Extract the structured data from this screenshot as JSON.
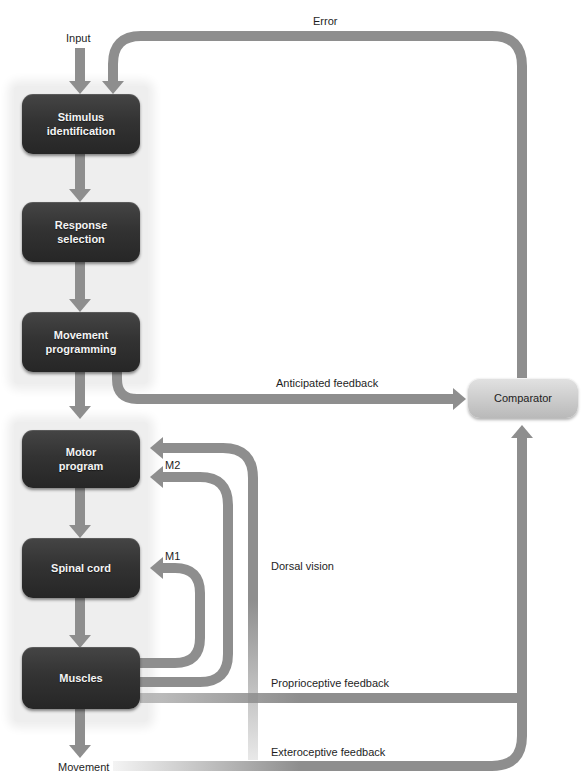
{
  "colors": {
    "arrow": "#8e8e8e",
    "box_dark_top": "#454545",
    "box_dark_bottom": "#262626",
    "comparator_top": "#e2e2e2",
    "comparator_bottom": "#b9b9b9",
    "panel": "#eeeeee"
  },
  "labels": {
    "input": "Input",
    "error": "Error",
    "anticipated_feedback": "Anticipated feedback",
    "m2": "M2",
    "m1": "M1",
    "dorsal_vision": "Dorsal vision",
    "proprioceptive_feedback": "Proprioceptive feedback",
    "exteroceptive_feedback": "Exteroceptive feedback",
    "movement": "Movement"
  },
  "boxes": {
    "stimulus_identification": "Stimulus\nidentification",
    "response_selection": "Response\nselection",
    "movement_programming": "Movement\nprogramming",
    "motor_program": "Motor\nprogram",
    "spinal_cord": "Spinal cord",
    "muscles": "Muscles"
  },
  "comparator": {
    "label": "Comparator"
  }
}
